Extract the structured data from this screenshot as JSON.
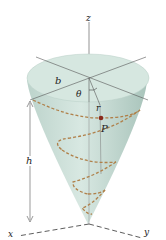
{
  "figure": {
    "type": "cone-helix-diagram",
    "labels": {
      "z": "z",
      "x": "x",
      "y": "y",
      "b": "b",
      "theta": "θ",
      "r": "r",
      "P": "P",
      "h": "h"
    },
    "colors": {
      "cone_fill": "#c9ddd6",
      "cone_top": "#d9e8e2",
      "helix": "#b0804a",
      "point": "#8a2a1c",
      "axis": "#555555"
    }
  }
}
